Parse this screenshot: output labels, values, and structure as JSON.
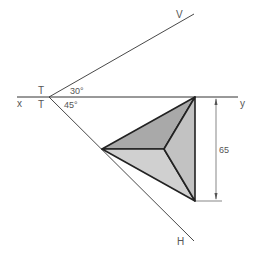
{
  "labels": {
    "x": "x",
    "y": "y",
    "t_top": "T",
    "t_bottom": "T",
    "v": "V",
    "h": "H",
    "angle_top": "30°",
    "angle_bottom": "45°",
    "dimension": "65"
  },
  "colors": {
    "line": "#333333",
    "face_dark": "#a9a9a9",
    "face_mid": "#c4c4c4",
    "face_light": "#d6d6d6",
    "text": "#555555"
  }
}
